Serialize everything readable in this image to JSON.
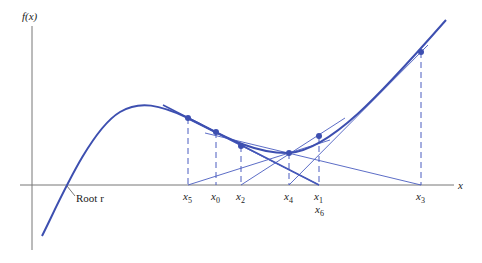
{
  "figure": {
    "y_axis_label": "f(x)",
    "x_axis_label": "x",
    "root_label": "Root r",
    "colors": {
      "curve": "#3d4fb0",
      "tangent": "#4a5cc0",
      "axis": "#777777",
      "text": "#222222"
    },
    "points": [
      {
        "name": "x0",
        "label_base": "x",
        "label_sub": "0"
      },
      {
        "name": "x1",
        "label_base": "x",
        "label_sub": "1"
      },
      {
        "name": "x2",
        "label_base": "x",
        "label_sub": "2"
      },
      {
        "name": "x3",
        "label_base": "x",
        "label_sub": "3"
      },
      {
        "name": "x4",
        "label_base": "x",
        "label_sub": "4"
      },
      {
        "name": "x5",
        "label_base": "x",
        "label_sub": "5"
      },
      {
        "name": "x6",
        "label_base": "x",
        "label_sub": "6"
      }
    ]
  }
}
